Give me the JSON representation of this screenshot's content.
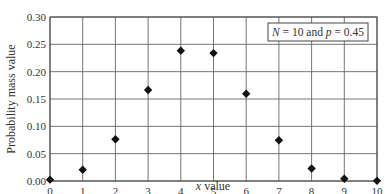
{
  "chart_data": {
    "type": "scatter",
    "title": "",
    "annotation": {
      "N_label": "N",
      "N_value": "10",
      "and_text": "and",
      "p_label": "p",
      "p_value": "0.45"
    },
    "xlabel_var": "x",
    "xlabel_rest": " value",
    "ylabel": "Probability mass value",
    "xlim": [
      0,
      10
    ],
    "ylim": [
      0,
      0.3
    ],
    "xticks": [
      "0",
      "1",
      "2",
      "3",
      "4",
      "5",
      "6",
      "7",
      "8",
      "9",
      "10"
    ],
    "yticks": [
      "0.00",
      "0.05",
      "0.10",
      "0.15",
      "0.20",
      "0.25",
      "0.30"
    ],
    "grid": true,
    "marker": "diamond",
    "x": [
      0,
      1,
      2,
      3,
      4,
      5,
      6,
      7,
      8,
      9,
      10
    ],
    "values": [
      0.0025,
      0.0207,
      0.0763,
      0.1665,
      0.2384,
      0.234,
      0.1596,
      0.0746,
      0.0229,
      0.0042,
      0.0003
    ]
  }
}
